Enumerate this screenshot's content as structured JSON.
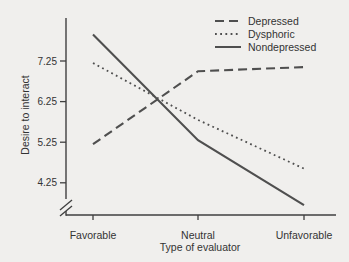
{
  "figure": {
    "background": "#f0efed",
    "line_color": "#4f4f4f",
    "axis_color": "#3f3f3f",
    "text_color": "#333333"
  },
  "chart_data": {
    "type": "line",
    "title": "",
    "xlabel": "Type of evaluator",
    "ylabel": "Desire to interact",
    "categories": [
      "Favorable",
      "Neutral",
      "Unfavorable"
    ],
    "y_ticks": [
      "7.25",
      "6.25",
      "5.25",
      "4.25"
    ],
    "ylim": [
      3.5,
      8.1
    ],
    "axis_break_bottom": true,
    "grid": false,
    "legend_position": "top-right",
    "series": [
      {
        "name": "Depressed",
        "style": "dashed",
        "values": [
          5.2,
          7.0,
          7.1
        ]
      },
      {
        "name": "Dysphoric",
        "style": "dotted",
        "values": [
          7.2,
          5.8,
          4.6
        ]
      },
      {
        "name": "Nondepressed",
        "style": "solid",
        "values": [
          7.9,
          5.3,
          3.7
        ]
      }
    ]
  }
}
